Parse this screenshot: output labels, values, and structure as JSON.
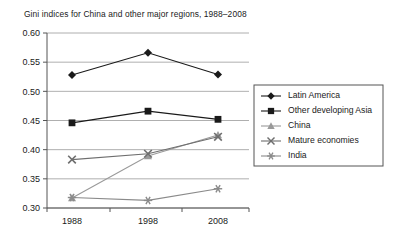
{
  "chart_data": {
    "type": "line",
    "title": "Gini indices for China and other major regions, 1988–2008",
    "xlabel": "",
    "ylabel": "",
    "categories": [
      "1988",
      "1998",
      "2008"
    ],
    "x": [
      1988,
      1998,
      2008
    ],
    "ylim": [
      0.3,
      0.6
    ],
    "ytick_labels": [
      "0.30",
      "0.35",
      "0.40",
      "0.45",
      "0.50",
      "0.55",
      "0.60"
    ],
    "ytick_values": [
      0.3,
      0.35,
      0.4,
      0.45,
      0.5,
      0.55,
      0.6
    ],
    "grid": true,
    "legend_position": "right",
    "series": [
      {
        "name": "Latin America",
        "marker": "diamond",
        "color": "#1a1a1a",
        "values": [
          0.528,
          0.566,
          0.529
        ]
      },
      {
        "name": "Other developing Asia",
        "marker": "square",
        "color": "#1a1a1a",
        "values": [
          0.446,
          0.466,
          0.452
        ]
      },
      {
        "name": "China",
        "marker": "triangle",
        "color": "#9a9a9a",
        "values": [
          0.317,
          0.389,
          0.425
        ]
      },
      {
        "name": "Mature economies",
        "marker": "x",
        "color": "#6e6e6e",
        "values": [
          0.383,
          0.393,
          0.422
        ]
      },
      {
        "name": "India",
        "marker": "asterisk",
        "color": "#8a8a8a",
        "values": [
          0.318,
          0.313,
          0.333
        ]
      }
    ]
  }
}
